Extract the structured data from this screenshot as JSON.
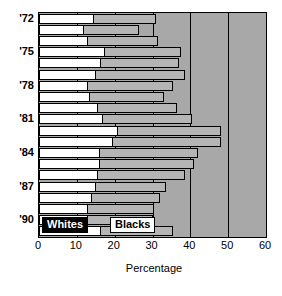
{
  "chart_data": {
    "type": "bar",
    "orientation": "horizontal",
    "title": "",
    "xlabel": "Percentage",
    "ylabel": "",
    "xlim": [
      0,
      60
    ],
    "xticks": [
      0,
      10,
      20,
      30,
      40,
      50,
      60
    ],
    "xtick_labels": [
      "0",
      "10",
      "20",
      "30",
      "40",
      "50",
      "60"
    ],
    "grid": true,
    "grid_axis": "x",
    "legend_position": "bottom-left-inside",
    "categories": [
      "'72",
      "'73",
      "'74",
      "'75",
      "'76",
      "'77",
      "'78",
      "'79",
      "'80",
      "'81",
      "'82",
      "'83",
      "'84",
      "'85",
      "'86",
      "'87",
      "'88",
      "'89",
      "'90",
      "'91"
    ],
    "ytick_labels": [
      "'72",
      "'75",
      "'78",
      "'81",
      "'84",
      "'87",
      "'90"
    ],
    "ytick_indices": [
      0,
      3,
      6,
      9,
      12,
      15,
      18
    ],
    "series": [
      {
        "name": "Whites",
        "color": "#ffffff",
        "values": [
          14.5,
          12.0,
          13.0,
          17.5,
          16.5,
          15.0,
          13.0,
          13.5,
          15.5,
          17.0,
          21.0,
          19.5,
          16.0,
          16.0,
          15.5,
          15.0,
          14.0,
          13.0,
          13.0,
          16.5
        ]
      },
      {
        "name": "Blacks",
        "color": "#b5b5b5",
        "values": [
          31.0,
          26.5,
          31.5,
          37.5,
          37.0,
          38.5,
          35.5,
          33.0,
          36.5,
          40.5,
          48.0,
          48.0,
          42.0,
          41.0,
          38.5,
          33.5,
          32.0,
          30.5,
          30.0,
          35.5
        ]
      }
    ]
  },
  "legend": {
    "whites_label": "Whites",
    "blacks_label": "Blacks"
  },
  "axis": {
    "x_title": "Percentage"
  }
}
